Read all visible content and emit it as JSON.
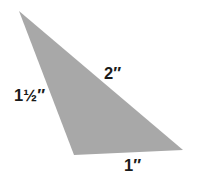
{
  "figure": {
    "kind": "geometry-diagram",
    "shape": "triangle",
    "background_color": "#ffffff",
    "fill_color": "#a8a8a8",
    "label_color": "#1a1a1a",
    "vertices": {
      "apex": [
        19,
        11
      ],
      "bottom_left": [
        74,
        155
      ],
      "bottom_right": [
        183,
        150
      ]
    },
    "polygon_points": "19,11 74,155 183,150"
  },
  "labels": {
    "left_side": "1½″",
    "hypotenuse": "2″",
    "bottom_side": "1″"
  }
}
